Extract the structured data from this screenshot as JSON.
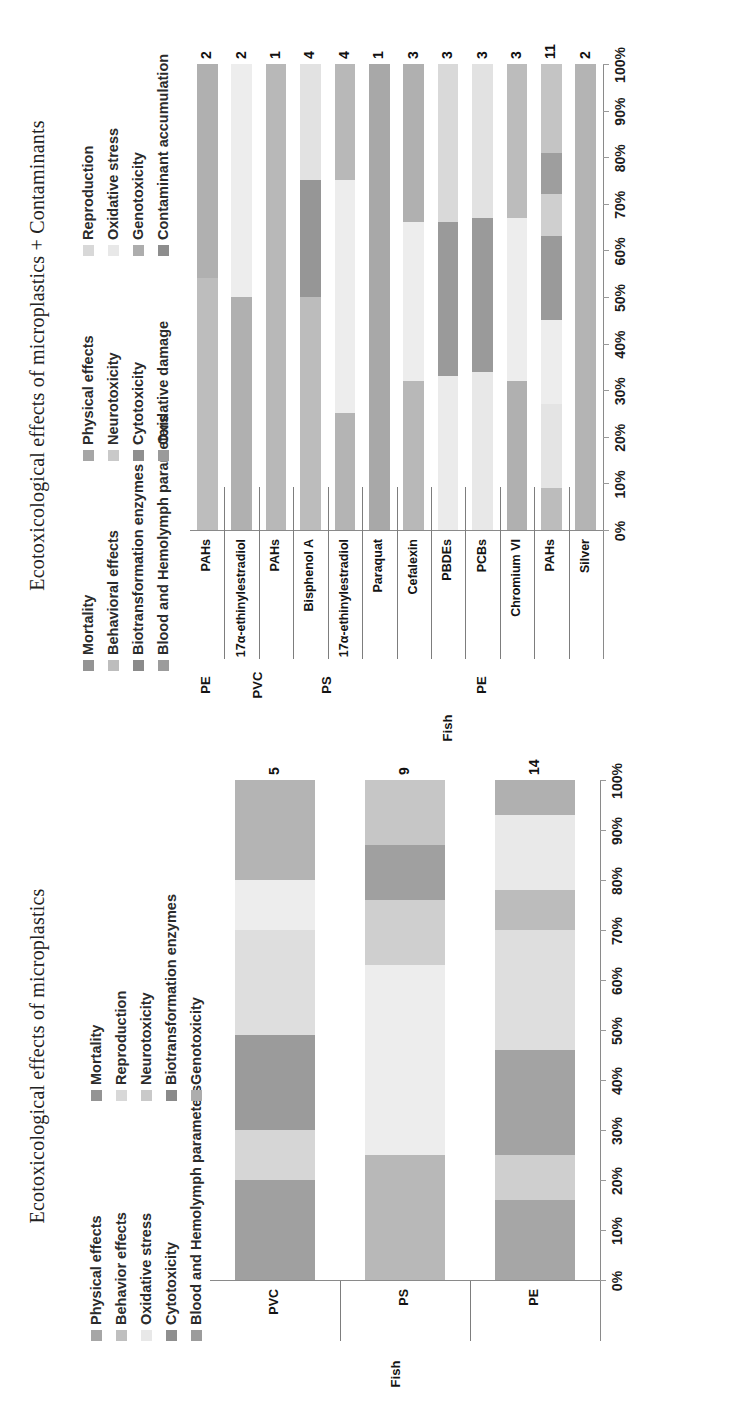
{
  "figure": {
    "left_panel_title": "Ecotoxicological effects of microplastics",
    "right_panel_title": "Ecotoxicological effects of microplastics + Contaminants"
  },
  "left_chart": {
    "legend": {
      "col1": [
        {
          "label": "Physical effects",
          "color": "#a6a6a6"
        },
        {
          "label": "Behavior effects",
          "color": "#bfbfbf"
        },
        {
          "label": "Oxidative stress",
          "color": "#e8e8e8"
        },
        {
          "label": "Cytotoxicity",
          "color": "#8f8f8f"
        },
        {
          "label": "Blood and Hemolymph parameters",
          "color": "#9c9c9c"
        }
      ],
      "col2": [
        {
          "label": "Mortality",
          "color": "#949494"
        },
        {
          "label": "Reproduction",
          "color": "#d8d8d8"
        },
        {
          "label": "Neurotoxicity",
          "color": "#c9c9c9"
        },
        {
          "label": "Biotransformation enzymes",
          "color": "#8a8a8a"
        },
        {
          "label": "Genotoxicity",
          "color": "#adadad"
        }
      ]
    },
    "axis": {
      "ticks": [
        "0%",
        "10%",
        "20%",
        "30%",
        "40%",
        "50%",
        "60%",
        "70%",
        "80%",
        "90%",
        "100%"
      ],
      "group_outer_label": "Fish"
    },
    "categories": [
      "PE",
      "PS",
      "PVC"
    ],
    "totals": [
      "14",
      "9",
      "5"
    ]
  },
  "right_chart": {
    "legend": {
      "col1": [
        {
          "label": "Mortality",
          "color": "#949494"
        },
        {
          "label": "Behavioral effects",
          "color": "#bdbdbd"
        },
        {
          "label": "Biotransformation enzymes",
          "color": "#8a8a8a"
        },
        {
          "label": "Blood and Hemolymph parameters",
          "color": "#9c9c9c"
        }
      ],
      "col2": [
        {
          "label": "Physical effects",
          "color": "#a6a6a6"
        },
        {
          "label": "Neurotoxicity",
          "color": "#c9c9c9"
        },
        {
          "label": "Cytotoxicity",
          "color": "#8f8f8f"
        },
        {
          "label": "Oxidative damage",
          "color": "#9a9a9a"
        }
      ],
      "col3": [
        {
          "label": "Reproduction",
          "color": "#d8d8d8"
        },
        {
          "label": "Oxidative stress",
          "color": "#e8e8e8"
        },
        {
          "label": "Genotoxicity",
          "color": "#adadad"
        },
        {
          "label": "Contaminant accumulation",
          "color": "#8d8d8d"
        }
      ]
    },
    "axis": {
      "ticks": [
        "0%",
        "10%",
        "20%",
        "30%",
        "40%",
        "50%",
        "60%",
        "70%",
        "80%",
        "90%",
        "100%"
      ],
      "group_outer_label": "Fish"
    },
    "categories": [
      "Silver",
      "PAHs",
      "Chromium VI",
      "PCBs",
      "PBDEs",
      "Cefalexin",
      "Paraquat",
      "17α-ethinylestradiol",
      "Bisphenol A",
      "PAHs",
      "17α-ethinylestradiol",
      "PAHs"
    ],
    "totals": [
      "2",
      "11",
      "3",
      "3",
      "3",
      "3",
      "1",
      "4",
      "4",
      "1",
      "2",
      "2"
    ],
    "groups": [
      {
        "label": "PE",
        "count": 7
      },
      {
        "label": "PS",
        "count": 2
      },
      {
        "label": "PVC",
        "count": 2
      },
      {
        "label": "PE",
        "count": 1
      }
    ]
  },
  "chart_data": [
    {
      "type": "bar",
      "title": "Ecotoxicological effects of microplastics",
      "subtype": "100% stacked horizontal bar",
      "xlabel": "",
      "ylabel": "",
      "xlim": [
        0,
        100
      ],
      "grid": false,
      "legend_position": "top",
      "tick_labels": [
        "0%",
        "10%",
        "20%",
        "30%",
        "40%",
        "50%",
        "60%",
        "70%",
        "80%",
        "90%",
        "100%"
      ],
      "categories": [
        "PE",
        "PS",
        "PVC"
      ],
      "category_group": "Fish",
      "data_labels": [
        "14",
        "9",
        "5"
      ],
      "series": [
        {
          "name": "Physical effects",
          "color": "#a6a6a6",
          "values": [
            7,
            0,
            10
          ]
        },
        {
          "name": "Mortality",
          "color": "#949494",
          "values": [
            14,
            22,
            10
          ]
        },
        {
          "name": "Behavior effects",
          "color": "#bfbfbf",
          "values": [
            7,
            0,
            10
          ]
        },
        {
          "name": "Reproduction",
          "color": "#d8d8d8",
          "values": [
            21,
            22,
            20
          ]
        },
        {
          "name": "Oxidative stress",
          "color": "#e8e8e8",
          "values": [
            14,
            11,
            10
          ]
        },
        {
          "name": "Neurotoxicity",
          "color": "#c9c9c9",
          "values": [
            7,
            11,
            0
          ]
        },
        {
          "name": "Cytotoxicity",
          "color": "#8f8f8f",
          "values": [
            14,
            0,
            20
          ]
        },
        {
          "name": "Biotransformation enzymes",
          "color": "#8a8a8a",
          "values": [
            7,
            23,
            10
          ]
        },
        {
          "name": "Blood and Hemolymph parameters",
          "color": "#9c9c9c",
          "values": [
            2,
            0,
            0
          ]
        },
        {
          "name": "Genotoxicity",
          "color": "#adadad",
          "values": [
            7,
            11,
            10
          ]
        }
      ]
    },
    {
      "type": "bar",
      "title": "Ecotoxicological effects of microplastics + Contaminants",
      "subtype": "100% stacked horizontal bar",
      "xlabel": "",
      "ylabel": "",
      "xlim": [
        0,
        100
      ],
      "grid": false,
      "legend_position": "top",
      "tick_labels": [
        "0%",
        "10%",
        "20%",
        "30%",
        "40%",
        "50%",
        "60%",
        "70%",
        "80%",
        "90%",
        "100%"
      ],
      "categories": [
        "Silver",
        "PAHs",
        "Chromium VI",
        "PCBs",
        "PBDEs",
        "Cefalexin",
        "Paraquat",
        "17α-ethinylestradiol",
        "Bisphenol A",
        "PAHs",
        "17α-ethinylestradiol",
        "PAHs"
      ],
      "category_groups": [
        "PE",
        "PE",
        "PE",
        "PE",
        "PE",
        "PE",
        "PE",
        "PS",
        "PS",
        "PVC",
        "PVC",
        "PE"
      ],
      "category_group_outer": "Fish",
      "data_labels": [
        "2",
        "11",
        "3",
        "3",
        "3",
        "3",
        "1",
        "4",
        "4",
        "1",
        "2",
        "2"
      ],
      "series": [
        {
          "name": "Mortality",
          "color": "#949494",
          "values": [
            0,
            9,
            0,
            0,
            0,
            0,
            0,
            12,
            0,
            0,
            0,
            0
          ]
        },
        {
          "name": "Physical effects",
          "color": "#a6a6a6",
          "values": [
            0,
            0,
            0,
            0,
            0,
            0,
            0,
            0,
            0,
            0,
            0,
            0
          ]
        },
        {
          "name": "Reproduction",
          "color": "#d8d8d8",
          "values": [
            0,
            18,
            0,
            0,
            0,
            0,
            0,
            38,
            0,
            0,
            0,
            0
          ]
        },
        {
          "name": "Behavioral effects",
          "color": "#bdbdbd",
          "values": [
            0,
            0,
            0,
            0,
            0,
            0,
            0,
            0,
            0,
            0,
            0,
            0
          ]
        },
        {
          "name": "Neurotoxicity",
          "color": "#c9c9c9",
          "values": [
            0,
            0,
            0,
            0,
            0,
            0,
            0,
            0,
            0,
            0,
            0,
            0
          ]
        },
        {
          "name": "Oxidative stress",
          "color": "#e8e8e8",
          "values": [
            0,
            18,
            30,
            26,
            24,
            28,
            0,
            0,
            12,
            0,
            45,
            0
          ]
        },
        {
          "name": "Biotransformation enzymes",
          "color": "#8a8a8a",
          "values": [
            0,
            0,
            0,
            0,
            0,
            0,
            0,
            0,
            0,
            0,
            0,
            0
          ]
        },
        {
          "name": "Cytotoxicity",
          "color": "#8f8f8f",
          "values": [
            0,
            18,
            0,
            26,
            28,
            0,
            0,
            0,
            24,
            0,
            0,
            0
          ]
        },
        {
          "name": "Genotoxicity",
          "color": "#adadad",
          "values": [
            0,
            0,
            0,
            0,
            0,
            0,
            0,
            0,
            0,
            0,
            0,
            0
          ]
        },
        {
          "name": "Oxidative damage",
          "color": "#9a9a9a",
          "values": [
            0,
            0,
            0,
            0,
            0,
            0,
            0,
            0,
            0,
            0,
            0,
            0
          ]
        },
        {
          "name": "Blood and Hemolymph parameters",
          "color": "#9c9c9c",
          "values": [
            0,
            0,
            0,
            0,
            0,
            0,
            0,
            0,
            0,
            0,
            0,
            0
          ]
        },
        {
          "name": "Contaminant accumulation",
          "color": "#8d8d8d",
          "values": [
            100,
            37,
            70,
            48,
            48,
            72,
            100,
            50,
            64,
            100,
            55,
            100
          ]
        }
      ]
    }
  ],
  "left_bars": [
    {
      "label": "PE",
      "total": "14",
      "segments": [
        {
          "name": "Contaminant-free mix A",
          "color": "#a6a6a6",
          "pct": 16
        },
        {
          "name": "seg-b",
          "color": "#cfcfcf",
          "pct": 9
        },
        {
          "name": "seg-c",
          "color": "#a3a3a3",
          "pct": 21
        },
        {
          "name": "seg-d",
          "color": "#dedede",
          "pct": 24
        },
        {
          "name": "seg-e",
          "color": "#bcbcbc",
          "pct": 8
        },
        {
          "name": "seg-f",
          "color": "#e9e9e9",
          "pct": 15
        },
        {
          "name": "seg-g",
          "color": "#b0b0b0",
          "pct": 7
        }
      ]
    },
    {
      "label": "PS",
      "total": "9",
      "segments": [
        {
          "name": "seg-a",
          "color": "#b8b8b8",
          "pct": 25
        },
        {
          "name": "seg-b",
          "color": "#ededed",
          "pct": 38
        },
        {
          "name": "seg-c",
          "color": "#cfcfcf",
          "pct": 13
        },
        {
          "name": "seg-d",
          "color": "#a0a0a0",
          "pct": 11
        },
        {
          "name": "seg-e",
          "color": "#c6c6c6",
          "pct": 13
        }
      ]
    },
    {
      "label": "PVC",
      "total": "5",
      "segments": [
        {
          "name": "seg-a",
          "color": "#a0a0a0",
          "pct": 20
        },
        {
          "name": "seg-b",
          "color": "#d6d6d6",
          "pct": 10
        },
        {
          "name": "seg-c",
          "color": "#9b9b9b",
          "pct": 19
        },
        {
          "name": "seg-d",
          "color": "#dedede",
          "pct": 21
        },
        {
          "name": "seg-e",
          "color": "#ededed",
          "pct": 10
        },
        {
          "name": "seg-f",
          "color": "#b4b4b4",
          "pct": 20
        }
      ]
    }
  ],
  "right_bars": [
    {
      "label": "Silver",
      "total": "2",
      "group": "PE",
      "segments": [
        {
          "name": "seg-a",
          "color": "#b4b4b4",
          "pct": 100
        }
      ]
    },
    {
      "label": "PAHs",
      "total": "11",
      "group": "PE",
      "segments": [
        {
          "name": "seg-a",
          "color": "#bcbcbc",
          "pct": 9
        },
        {
          "name": "seg-b",
          "color": "#e4e4e4",
          "pct": 18
        },
        {
          "name": "seg-c",
          "color": "#ededed",
          "pct": 18
        },
        {
          "name": "seg-d",
          "color": "#9a9a9a",
          "pct": 18
        },
        {
          "name": "seg-e",
          "color": "#cfcfcf",
          "pct": 9
        },
        {
          "name": "seg-f",
          "color": "#9e9e9e",
          "pct": 9
        },
        {
          "name": "seg-g",
          "color": "#c4c4c4",
          "pct": 19
        }
      ]
    },
    {
      "label": "Chromium VI",
      "total": "3",
      "group": "PE",
      "segments": [
        {
          "name": "seg-a",
          "color": "#b0b0b0",
          "pct": 32
        },
        {
          "name": "seg-b",
          "color": "#ededed",
          "pct": 35
        },
        {
          "name": "seg-c",
          "color": "#bcbcbc",
          "pct": 33
        }
      ]
    },
    {
      "label": "PCBs",
      "total": "3",
      "group": "PE",
      "segments": [
        {
          "name": "seg-a",
          "color": "#e8e8e8",
          "pct": 34
        },
        {
          "name": "seg-b",
          "color": "#9a9a9a",
          "pct": 33
        },
        {
          "name": "seg-c",
          "color": "#e2e2e2",
          "pct": 33
        }
      ]
    },
    {
      "label": "PBDEs",
      "total": "3",
      "group": "PE",
      "segments": [
        {
          "name": "seg-a",
          "color": "#ebebeb",
          "pct": 33
        },
        {
          "name": "seg-b",
          "color": "#9a9a9a",
          "pct": 33
        },
        {
          "name": "seg-c",
          "color": "#d9d9d9",
          "pct": 34
        }
      ]
    },
    {
      "label": "Cefalexin",
      "total": "3",
      "group": "PE",
      "segments": [
        {
          "name": "seg-a",
          "color": "#b8b8b8",
          "pct": 32
        },
        {
          "name": "seg-b",
          "color": "#ededed",
          "pct": 34
        },
        {
          "name": "seg-c",
          "color": "#b0b0b0",
          "pct": 34
        }
      ]
    },
    {
      "label": "Paraquat",
      "total": "1",
      "group": "PE",
      "segments": [
        {
          "name": "seg-a",
          "color": "#a8a8a8",
          "pct": 100
        }
      ]
    },
    {
      "label": "17α-ethinylestradiol",
      "total": "4",
      "group": "PS",
      "segments": [
        {
          "name": "seg-a",
          "color": "#b4b4b4",
          "pct": 25
        },
        {
          "name": "seg-b",
          "color": "#ededed",
          "pct": 50
        },
        {
          "name": "seg-c",
          "color": "#b8b8b8",
          "pct": 25
        }
      ]
    },
    {
      "label": "Bisphenol A",
      "total": "4",
      "group": "PS",
      "segments": [
        {
          "name": "seg-a",
          "color": "#bcbcbc",
          "pct": 50
        },
        {
          "name": "seg-b",
          "color": "#969696",
          "pct": 25
        },
        {
          "name": "seg-c",
          "color": "#e2e2e2",
          "pct": 25
        }
      ]
    },
    {
      "label": "PAHs",
      "total": "1",
      "group": "PVC",
      "segments": [
        {
          "name": "seg-a",
          "color": "#b8b8b8",
          "pct": 100
        }
      ]
    },
    {
      "label": "17α-ethinylestradiol",
      "total": "2",
      "group": "PVC",
      "segments": [
        {
          "name": "seg-a",
          "color": "#b0b0b0",
          "pct": 50
        },
        {
          "name": "seg-b",
          "color": "#ededed",
          "pct": 50
        }
      ]
    },
    {
      "label": "PAHs",
      "total": "2",
      "group": "PE",
      "segments": [
        {
          "name": "seg-a",
          "color": "#bdbdbd",
          "pct": 54
        },
        {
          "name": "seg-b",
          "color": "#b0b0b0",
          "pct": 46
        }
      ]
    }
  ]
}
